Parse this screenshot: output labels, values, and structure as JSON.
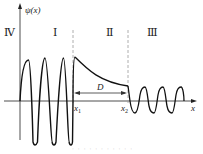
{
  "figure": {
    "y_axis_label": "ψ(x)",
    "x_axis_label": "x",
    "region_labels": [
      "Ⅳ",
      "Ⅰ",
      "Ⅱ",
      "Ⅲ"
    ],
    "boundary_labels": {
      "x1_base": "x",
      "x1_sub": "1",
      "x2_base": "x",
      "x2_sub": "2"
    },
    "width_label": "D",
    "caption": "· · · · · · · · · · ·"
  },
  "colors": {
    "curve": "#111111",
    "axis": "#222222",
    "dashed": "#999999",
    "arrow": "#333333"
  }
}
